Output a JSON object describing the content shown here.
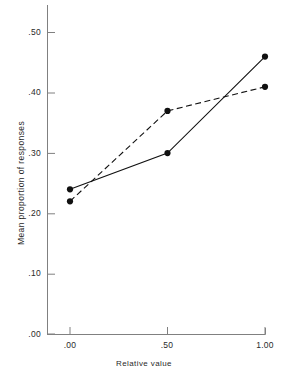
{
  "chart_data": {
    "type": "line",
    "title": "",
    "xlabel": "Relative value",
    "ylabel": "Mean proportion of responses",
    "x": [
      0.0,
      0.5,
      1.0
    ],
    "xtick_labels": [
      ".00",
      ".50",
      "1.00"
    ],
    "ytick_labels": [
      ".00",
      ".10",
      ".20",
      ".30",
      ".40",
      ".50"
    ],
    "ytick_values": [
      0.0,
      0.1,
      0.2,
      0.3,
      0.4,
      0.5
    ],
    "xlim": [
      0.0,
      1.0
    ],
    "ylim": [
      0.0,
      0.55
    ],
    "grid": false,
    "legend": false,
    "legend_position": "none",
    "marker": "filled-circle",
    "series": [
      {
        "name": "solid",
        "style": "solid",
        "color": "#111111",
        "values": [
          0.24,
          0.3,
          0.46
        ]
      },
      {
        "name": "dashed",
        "style": "dashed",
        "color": "#111111",
        "values": [
          0.22,
          0.37,
          0.41
        ]
      }
    ]
  },
  "axes": {
    "x_tick_labels": [
      ".00",
      ".50",
      "1.00"
    ],
    "y_tick_labels": [
      ".50",
      ".40",
      ".30",
      ".20",
      ".10",
      ".00"
    ],
    "x_axis_label": "Relative value",
    "y_axis_label": "Mean proportion of responses"
  }
}
